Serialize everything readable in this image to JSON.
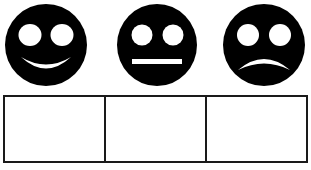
{
  "page": {
    "background_color": "#ffffff",
    "ink_color": "#000000",
    "border_color": "#1a1a1a"
  },
  "faces": {
    "row_label": "Emotion face icons",
    "items": [
      {
        "id": "happy",
        "icon_name": "happy-face-icon",
        "label": "Happy face",
        "mouth": "smile",
        "fill_color": "#000000",
        "feature_color": "#ffffff"
      },
      {
        "id": "neutral",
        "icon_name": "neutral-face-icon",
        "label": "Neutral face",
        "mouth": "straight-line",
        "fill_color": "#000000",
        "feature_color": "#ffffff"
      },
      {
        "id": "sad",
        "icon_name": "sad-face-icon",
        "label": "Sad face",
        "mouth": "frown",
        "fill_color": "#000000",
        "feature_color": "#ffffff"
      }
    ]
  },
  "answer_boxes": {
    "row_label": "Answer boxes",
    "cells": [
      {
        "id": "box-1",
        "value": "",
        "placeholder": ""
      },
      {
        "id": "box-2",
        "value": "",
        "placeholder": ""
      },
      {
        "id": "box-3",
        "value": "",
        "placeholder": ""
      }
    ]
  }
}
